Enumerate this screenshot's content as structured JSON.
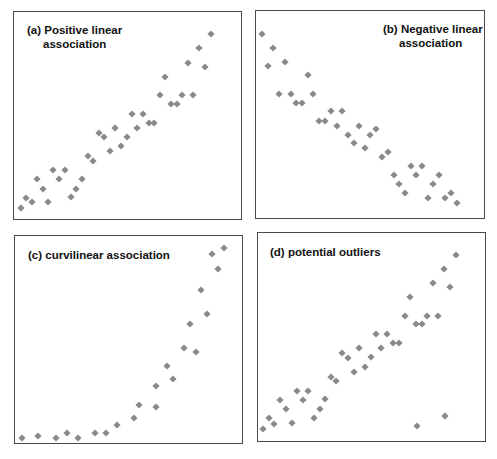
{
  "point_color": "#8a8a8a",
  "border_color": "#4a4a4a",
  "chart_data": [
    {
      "type": "scatter",
      "title": "(a) Positive linear association",
      "title_lines": [
        "(a) Positive linear",
        "association"
      ],
      "xlabel": "",
      "ylabel": "",
      "grid": false,
      "points": [
        [
          21,
          208
        ],
        [
          26,
          198
        ],
        [
          32,
          202
        ],
        [
          37,
          179
        ],
        [
          43,
          189
        ],
        [
          48,
          202
        ],
        [
          53,
          170
        ],
        [
          59,
          179
        ],
        [
          65,
          170
        ],
        [
          71,
          197
        ],
        [
          76,
          189
        ],
        [
          82,
          179
        ],
        [
          88,
          156
        ],
        [
          93,
          161
        ],
        [
          99,
          133
        ],
        [
          104,
          137
        ],
        [
          110,
          151
        ],
        [
          115,
          128
        ],
        [
          121,
          146
        ],
        [
          127,
          137
        ],
        [
          132,
          114
        ],
        [
          137,
          128
        ],
        [
          143,
          114
        ],
        [
          149,
          123
        ],
        [
          154,
          123
        ],
        [
          160,
          95
        ],
        [
          165,
          77
        ],
        [
          171,
          104
        ],
        [
          177,
          104
        ],
        [
          182,
          95
        ],
        [
          188,
          63
        ],
        [
          193,
          95
        ],
        [
          199,
          48
        ],
        [
          205,
          67
        ],
        [
          211,
          34
        ]
      ]
    },
    {
      "type": "scatter",
      "title": "(b) Negative linear association",
      "title_lines": [
        "(b) Negative linear",
        "association"
      ],
      "xlabel": "",
      "ylabel": "",
      "grid": false,
      "points": [
        [
          262,
          34
        ],
        [
          268,
          66
        ],
        [
          273,
          48
        ],
        [
          279,
          94
        ],
        [
          285,
          62
        ],
        [
          291,
          94
        ],
        [
          296,
          103
        ],
        [
          302,
          103
        ],
        [
          308,
          75
        ],
        [
          313,
          94
        ],
        [
          319,
          121
        ],
        [
          325,
          121
        ],
        [
          331,
          111
        ],
        [
          337,
          126
        ],
        [
          342,
          111
        ],
        [
          348,
          135
        ],
        [
          354,
          143
        ],
        [
          359,
          126
        ],
        [
          365,
          148
        ],
        [
          370,
          135
        ],
        [
          376,
          129
        ],
        [
          382,
          157
        ],
        [
          388,
          152
        ],
        [
          394,
          175
        ],
        [
          399,
          184
        ],
        [
          405,
          193
        ],
        [
          411,
          166
        ],
        [
          416,
          175
        ],
        [
          422,
          166
        ],
        [
          428,
          198
        ],
        [
          433,
          184
        ],
        [
          439,
          175
        ],
        [
          445,
          198
        ],
        [
          451,
          193
        ],
        [
          457,
          203
        ]
      ]
    },
    {
      "type": "scatter",
      "title": "(c) curvilinear association",
      "title_lines": [
        "(c) curvilinear association"
      ],
      "xlabel": "",
      "ylabel": "",
      "grid": false,
      "points": [
        [
          22,
          438
        ],
        [
          38,
          436
        ],
        [
          56,
          438
        ],
        [
          67,
          433
        ],
        [
          78,
          438
        ],
        [
          95,
          433
        ],
        [
          106,
          433
        ],
        [
          117,
          425
        ],
        [
          134,
          418
        ],
        [
          139,
          405
        ],
        [
          156,
          407
        ],
        [
          156,
          386
        ],
        [
          173,
          379
        ],
        [
          167,
          366
        ],
        [
          184,
          348
        ],
        [
          196,
          352
        ],
        [
          190,
          324
        ],
        [
          207,
          314
        ],
        [
          201,
          290
        ],
        [
          218,
          269
        ],
        [
          212,
          254
        ],
        [
          224,
          248
        ]
      ]
    },
    {
      "type": "scatter",
      "title": "(d) potential outliers",
      "title_lines": [
        "(d) potential outliers"
      ],
      "xlabel": "",
      "ylabel": "",
      "grid": false,
      "points": [
        [
          263,
          429
        ],
        [
          269,
          418
        ],
        [
          274,
          424
        ],
        [
          280,
          400
        ],
        [
          286,
          409
        ],
        [
          292,
          423
        ],
        [
          297,
          391
        ],
        [
          303,
          400
        ],
        [
          308,
          391
        ],
        [
          314,
          418
        ],
        [
          320,
          409
        ],
        [
          325,
          399
        ],
        [
          331,
          377
        ],
        [
          336,
          381
        ],
        [
          342,
          353
        ],
        [
          348,
          358
        ],
        [
          354,
          372
        ],
        [
          359,
          348
        ],
        [
          365,
          367
        ],
        [
          371,
          357
        ],
        [
          376,
          334
        ],
        [
          381,
          348
        ],
        [
          387,
          334
        ],
        [
          393,
          343
        ],
        [
          399,
          343
        ],
        [
          405,
          316
        ],
        [
          410,
          297
        ],
        [
          416,
          324
        ],
        [
          422,
          324
        ],
        [
          427,
          316
        ],
        [
          433,
          283
        ],
        [
          438,
          316
        ],
        [
          444,
          269
        ],
        [
          450,
          287
        ],
        [
          456,
          255
        ]
      ],
      "outliers": [
        [
          417,
          426
        ],
        [
          445,
          416
        ]
      ]
    }
  ]
}
